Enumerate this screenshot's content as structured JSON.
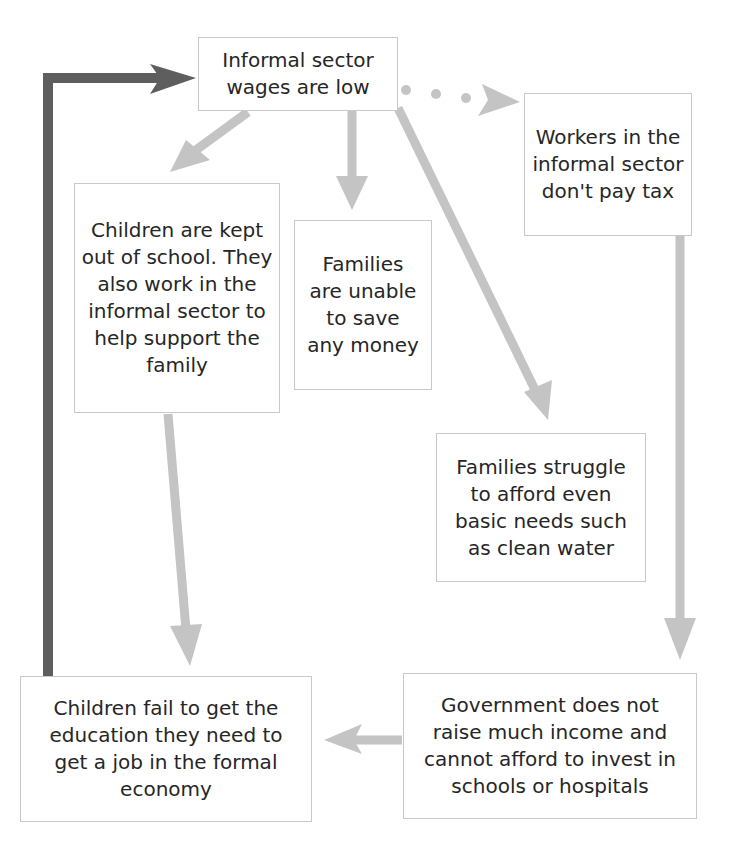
{
  "diagram": {
    "type": "cause-effect cycle",
    "colors": {
      "light_arrow": "#c4c4c4",
      "dark_arrow": "#5e5e5e",
      "box_border": "#c9c9c9",
      "text": "#262626"
    },
    "nodes": {
      "wages_low": "Informal sector wages are low",
      "no_tax": "Workers in the informal sector don't pay tax",
      "children_out": "Children are kept out of school. They also work in the informal sector to help support the family",
      "cannot_save": "Families are unable to save any money",
      "basic_needs": "Families struggle to afford even basic needs such as clean water",
      "fail_education": "Children fail to get the education they need to get a job in the formal economy",
      "government": "Government does not raise much income and cannot afford to invest in schools or hospitals"
    },
    "edges": [
      {
        "from": "wages_low",
        "to": "children_out",
        "style": "solid-light"
      },
      {
        "from": "wages_low",
        "to": "cannot_save",
        "style": "solid-light"
      },
      {
        "from": "wages_low",
        "to": "basic_needs",
        "style": "solid-light"
      },
      {
        "from": "wages_low",
        "to": "no_tax",
        "style": "dotted-light"
      },
      {
        "from": "children_out",
        "to": "fail_education",
        "style": "solid-light"
      },
      {
        "from": "no_tax",
        "to": "government",
        "style": "solid-light"
      },
      {
        "from": "government",
        "to": "fail_education",
        "style": "solid-light"
      },
      {
        "from": "fail_education",
        "to": "wages_low",
        "style": "solid-dark"
      }
    ]
  }
}
